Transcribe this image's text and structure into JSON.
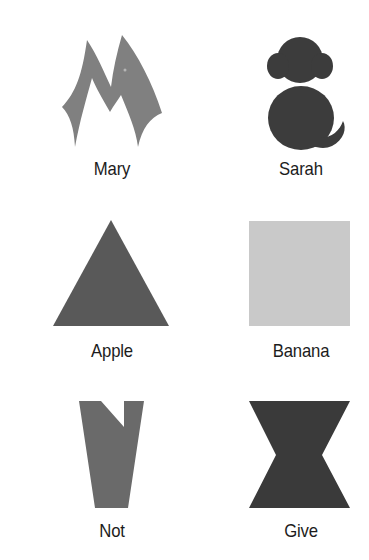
{
  "items": [
    {
      "label": "Mary",
      "shape": "m-letter",
      "color": "#808080"
    },
    {
      "label": "Sarah",
      "shape": "monkey-silhouette",
      "color": "#3c3c3c"
    },
    {
      "label": "Apple",
      "shape": "triangle",
      "color": "#595959"
    },
    {
      "label": "Banana",
      "shape": "square",
      "color": "#c9c9c9"
    },
    {
      "label": "Not",
      "shape": "notched-trapezoid",
      "color": "#6a6a6a"
    },
    {
      "label": "Give",
      "shape": "hourglass",
      "color": "#3a3a3a"
    }
  ]
}
